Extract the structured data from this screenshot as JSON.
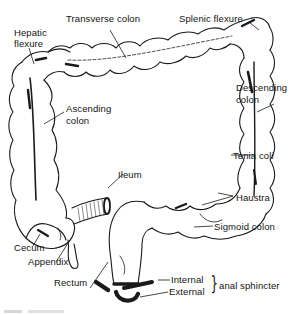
{
  "figure": {
    "labels": {
      "transverse_colon": "Transverse colon",
      "splenic_flexure": "Splenic flexure",
      "hepatic_flexure_line1": "Hepatic",
      "hepatic_flexure_line2": "flexure",
      "descending_colon_line1": "Descending",
      "descending_colon_line2": "colon",
      "ascending_colon_line1": "Ascending",
      "ascending_colon_line2": "colon",
      "tenia_coli": "Tenia coli",
      "ileum": "Ileum",
      "haustra": "Haustra",
      "sigmoid_colon": "Sigmoid colon",
      "cecum": "Cecum",
      "appendix": "Appendix",
      "rectum": "Rectum",
      "internal": "Internal",
      "external": "External",
      "anal_sphincter": "anal sphincter"
    },
    "brace_glyph": "}",
    "colors": {
      "ink": "#141414",
      "background": "#ffffff"
    }
  }
}
